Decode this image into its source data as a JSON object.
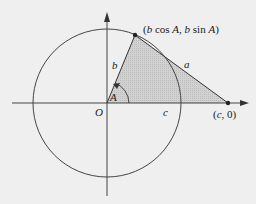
{
  "diagram": {
    "labels": {
      "origin": "O",
      "angle": "A",
      "side_b": "b",
      "side_a": "a",
      "side_c": "c",
      "point_top": "(b cos A, b sin A)",
      "point_right": "(c, 0)"
    },
    "colors": {
      "background": "#efefef",
      "line": "#333333",
      "triangle_fill": "#c8c8c8"
    }
  }
}
